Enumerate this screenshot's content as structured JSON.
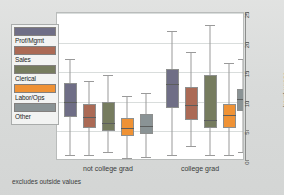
{
  "chart_data": {
    "type": "box",
    "title": "",
    "xlabel": "",
    "ylabel": "hourly wage",
    "ylim": [
      0,
      25
    ],
    "yticks": [
      0,
      5,
      10,
      15,
      20,
      25
    ],
    "grid": true,
    "legend_position": "left",
    "footnote": "excludes outside values",
    "groups": [
      "not college grad",
      "college grad"
    ],
    "series": [
      {
        "name": "Prof/Mgmt",
        "color": "#6f6e86"
      },
      {
        "name": "Sales",
        "color": "#ab6a55"
      },
      {
        "name": "Clerical",
        "color": "#767c5f"
      },
      {
        "name": "Labor/Ops",
        "color": "#ef9235"
      },
      {
        "name": "Other",
        "color": "#8a9395"
      }
    ],
    "boxes": [
      {
        "group": "not college grad",
        "series": "Prof/Mgmt",
        "color": "#6f6e86",
        "lower_whisker": 1.0,
        "q1": 7.5,
        "median": 10.0,
        "q3": 13.1,
        "upper_whisker": 17.2
      },
      {
        "group": "not college grad",
        "series": "Sales",
        "color": "#ab6a55",
        "lower_whisker": 1.0,
        "q1": 5.5,
        "median": 7.4,
        "q3": 9.6,
        "upper_whisker": 13.6
      },
      {
        "group": "not college grad",
        "series": "Clerical",
        "color": "#767c5f",
        "lower_whisker": 1.6,
        "q1": 5.0,
        "median": 6.5,
        "q3": 10.0,
        "upper_whisker": 14.6
      },
      {
        "group": "not college grad",
        "series": "Labor/Ops",
        "color": "#ef9235",
        "lower_whisker": 0.5,
        "q1": 4.2,
        "median": 5.5,
        "q3": 7.2,
        "upper_whisker": 11.0
      },
      {
        "group": "not college grad",
        "series": "Other",
        "color": "#8a9395",
        "lower_whisker": 0.7,
        "q1": 4.5,
        "median": 6.0,
        "q3": 8.0,
        "upper_whisker": 11.5
      },
      {
        "group": "college grad",
        "series": "Prof/Mgmt",
        "color": "#6f6e86",
        "lower_whisker": 1.0,
        "q1": 9.0,
        "median": 13.0,
        "q3": 15.6,
        "upper_whisker": 22.0
      },
      {
        "group": "college grad",
        "series": "Sales",
        "color": "#ab6a55",
        "lower_whisker": 2.5,
        "q1": 7.0,
        "median": 9.5,
        "q3": 12.5,
        "upper_whisker": 18.5
      },
      {
        "group": "college grad",
        "series": "Clerical",
        "color": "#767c5f",
        "lower_whisker": 1.0,
        "q1": 5.5,
        "median": 7.0,
        "q3": 14.5,
        "upper_whisker": 23.0
      },
      {
        "group": "college grad",
        "series": "Labor/Ops",
        "color": "#ef9235",
        "lower_whisker": 1.0,
        "q1": 5.5,
        "median": 7.8,
        "q3": 9.6,
        "upper_whisker": 16.5
      },
      {
        "group": "college grad",
        "series": "Other",
        "color": "#8a9395",
        "lower_whisker": 1.6,
        "q1": 8.5,
        "median": 10.5,
        "q3": 12.2,
        "upper_whisker": 17.2
      }
    ]
  },
  "axis": {
    "y_title": "hourly wage",
    "tick_labels": [
      "0",
      "5",
      "10",
      "15",
      "20",
      "25"
    ]
  },
  "xaxis": {
    "left_label": "not college grad",
    "right_label": "college grad",
    "note": "excludes outside values"
  },
  "legend": {
    "items": [
      {
        "label": "Prof/Mgmt",
        "color": "#6f6e86"
      },
      {
        "label": "Sales",
        "color": "#ab6a55"
      },
      {
        "label": "Clerical",
        "color": "#767c5f"
      },
      {
        "label": "Labor/Ops",
        "color": "#ef9235"
      },
      {
        "label": "Other",
        "color": "#8a9395"
      }
    ]
  },
  "colors": {
    "plot_background": "#ffffff",
    "figure_background": "#dcdedd",
    "gridline": "#d9dddc",
    "axis": "#8b8d8c",
    "whisker": "#9a9a9a"
  }
}
